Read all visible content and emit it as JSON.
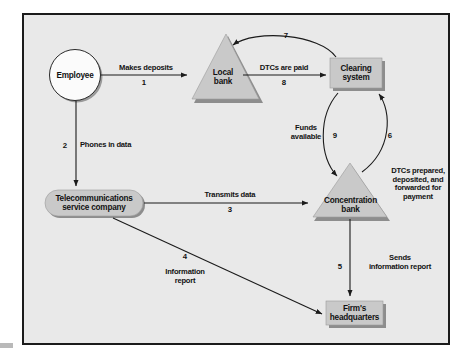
{
  "figure": {
    "type": "flow-diagram",
    "background_color": "#e9e9e9",
    "frame_color": "#1b1b1b",
    "shape_fill": "#c9c9c9",
    "shape_shadow": "#8f8f8f",
    "text_color": "#121212"
  },
  "nodes": [
    {
      "id": "employee",
      "shape": "circle",
      "label": "Employee"
    },
    {
      "id": "local-bank",
      "shape": "triangle",
      "label": "Local\nbank"
    },
    {
      "id": "clearing-system",
      "shape": "rectangle",
      "label": "Clearing\nsystem"
    },
    {
      "id": "telecom",
      "shape": "pill",
      "label": "Telecommunications\nservice company"
    },
    {
      "id": "concentration-bank",
      "shape": "triangle",
      "label": "Concentration\nbank"
    },
    {
      "id": "firm-hq",
      "shape": "rectangle",
      "label": "Firm's\nheadquarters"
    }
  ],
  "edges": [
    {
      "id": "e1",
      "from": "employee",
      "to": "local-bank",
      "label": "Makes deposits",
      "number": "1"
    },
    {
      "id": "e2",
      "from": "employee",
      "to": "telecom",
      "label": "Phones in data",
      "number": "2"
    },
    {
      "id": "e3",
      "from": "telecom",
      "to": "concentration-bank",
      "label": "Transmits data",
      "number": "3"
    },
    {
      "id": "e4",
      "from": "telecom",
      "to": "firm-hq",
      "label": "Information\nreport",
      "number": "4"
    },
    {
      "id": "e5",
      "from": "concentration-bank",
      "to": "firm-hq",
      "label": "Sends\ninformation report",
      "number": "5"
    },
    {
      "id": "e6",
      "from": "concentration-bank",
      "to": "clearing-system",
      "label": "DTCs prepared,\ndeposited, and\nforwarded for\npayment",
      "number": "6"
    },
    {
      "id": "e7",
      "from": "clearing-system",
      "to": "local-bank",
      "label": "",
      "number": "7"
    },
    {
      "id": "e8",
      "from": "local-bank",
      "to": "clearing-system",
      "label": "DTCs are paid",
      "number": "8"
    },
    {
      "id": "e9",
      "from": "clearing-system",
      "to": "concentration-bank",
      "label": "Funds\navailable",
      "number": "9"
    }
  ]
}
